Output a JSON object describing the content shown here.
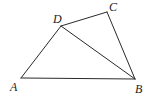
{
  "diagram": {
    "type": "geometry-quadrilateral",
    "points": {
      "A": {
        "label": "A",
        "x": 21,
        "y": 78,
        "label_x": 10,
        "label_y": 91
      },
      "B": {
        "label": "B",
        "x": 135,
        "y": 79,
        "label_x": 135,
        "label_y": 93
      },
      "C": {
        "label": "C",
        "x": 107,
        "y": 12,
        "label_x": 109,
        "label_y": 11
      },
      "D": {
        "label": "D",
        "x": 61,
        "y": 26,
        "label_x": 53,
        "label_y": 23
      }
    },
    "segments": [
      {
        "name": "AB",
        "from": "A",
        "to": "B"
      },
      {
        "name": "AD",
        "from": "A",
        "to": "D"
      },
      {
        "name": "DC",
        "from": "D",
        "to": "C"
      },
      {
        "name": "CB",
        "from": "C",
        "to": "B"
      },
      {
        "name": "DB",
        "from": "D",
        "to": "B"
      }
    ],
    "colors": {
      "stroke": "#2a2a2a",
      "label": "#222222",
      "background": "#ffffff"
    }
  }
}
